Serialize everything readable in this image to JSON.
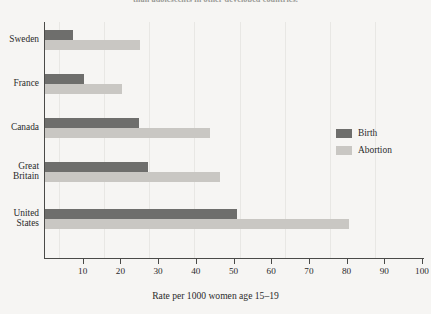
{
  "top_caption": "than adolescents in other developed countries.",
  "chart_data": {
    "type": "bar",
    "orientation": "horizontal",
    "title": "",
    "subtitle": "",
    "xlabel": "Rate per 1000 women age 15–19",
    "ylabel": "",
    "categories": [
      "Sweden",
      "France",
      "Canada",
      "Great Britain",
      "United States"
    ],
    "category_lines": [
      [
        "Sweden"
      ],
      [
        "France"
      ],
      [
        "Canada"
      ],
      [
        "Great",
        "Britain"
      ],
      [
        "United",
        "States"
      ]
    ],
    "series": [
      {
        "name": "Birth",
        "color": "#6e6e6c",
        "values": [
          7.7,
          10.6,
          25.2,
          27.6,
          51.2
        ]
      },
      {
        "name": "Abortion",
        "color": "#c9c7c3",
        "values": [
          25.5,
          20.7,
          44.0,
          46.7,
          80.9
        ]
      }
    ],
    "xlim": [
      0,
      100
    ],
    "xticks": [
      10,
      20,
      30,
      40,
      50,
      60,
      70,
      80,
      90,
      100
    ],
    "xtick_labels": [
      "10",
      "20",
      "30",
      "40",
      "50",
      "60",
      "70",
      "80",
      "90",
      "100"
    ],
    "grid": false,
    "legend_position": "center-right"
  },
  "legend": {
    "items": [
      {
        "label": "Birth",
        "color": "#6e6e6c"
      },
      {
        "label": "Abortion",
        "color": "#c9c7c3"
      }
    ]
  },
  "colors": {
    "background": "#f6f5f3",
    "axis": "#4a4a48",
    "text": "#2b2b2b",
    "birth": "#6e6e6c",
    "abortion": "#c9c7c3"
  }
}
